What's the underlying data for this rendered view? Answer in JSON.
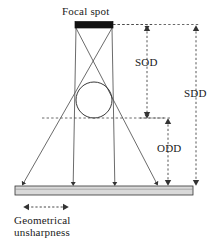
{
  "diagram": {
    "labels": {
      "focal_spot": "Focal spot",
      "sod": "SOD",
      "sdd": "SDD",
      "odd": "ODD",
      "unsharpness_line1": "Geometrical",
      "unsharpness_line2": "unsharpness"
    },
    "colors": {
      "focal_spot_fill": "#111111",
      "detector_fill": "#d9d9d9",
      "detector_stroke": "#333333",
      "ray_stroke": "#555555",
      "object_stroke": "#222222",
      "dimension_stroke": "#444444",
      "text": "#1a1a1a",
      "background": "#ffffff"
    },
    "geometry": {
      "focal_spot": {
        "x": 75,
        "y": 22,
        "width": 38,
        "height": 6
      },
      "source_left": {
        "x": 76,
        "y": 28
      },
      "source_right": {
        "x": 112,
        "y": 28
      },
      "object_circle": {
        "cx": 94,
        "cy": 100,
        "r": 18
      },
      "object_plane_y": 118,
      "detector": {
        "x": 15,
        "y": 186,
        "width": 178,
        "height": 9
      },
      "unsharpness_arrow": {
        "x1": 24,
        "x2": 68,
        "y": 207
      }
    },
    "dimension_lines": [
      {
        "name": "SOD",
        "from": "focal spot",
        "to": "object plane",
        "x": 147,
        "y_top": 27,
        "y_bottom": 118
      },
      {
        "name": "ODD",
        "from": "object plane",
        "to": "detector",
        "x": 168,
        "y_top": 118,
        "y_bottom": 186
      },
      {
        "name": "SDD",
        "from": "focal spot",
        "to": "detector",
        "x": 196,
        "y_top": 27,
        "y_bottom": 186
      }
    ],
    "rays": [
      {
        "name": "left-edge-outer",
        "from_x": 112,
        "from_y": 28,
        "to_x": 23,
        "to_y": 184
      },
      {
        "name": "left-edge-inner",
        "from_x": 76,
        "from_y": 28,
        "to_x": 73,
        "to_y": 184
      },
      {
        "name": "right-edge-inner",
        "from_x": 112,
        "from_y": 28,
        "to_x": 115,
        "to_y": 184
      },
      {
        "name": "right-edge-outer",
        "from_x": 76,
        "from_y": 28,
        "to_x": 157,
        "to_y": 184
      }
    ]
  }
}
